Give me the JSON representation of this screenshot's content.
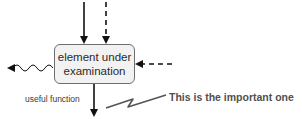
{
  "diagram": {
    "box": {
      "line1": "element under",
      "line2": "examination"
    },
    "labels": {
      "useful_function": "useful function",
      "annotation": "This is the important one"
    },
    "arrows": [
      {
        "id": "input-solid",
        "style": "solid",
        "direction": "down",
        "target": "box-top"
      },
      {
        "id": "input-dashed",
        "style": "dashed",
        "direction": "down",
        "target": "box-top"
      },
      {
        "id": "input-dashed-right",
        "style": "dashed",
        "direction": "left",
        "target": "box-right"
      },
      {
        "id": "output-wavy",
        "style": "wavy",
        "direction": "left",
        "source": "box-left"
      },
      {
        "id": "output-useful",
        "style": "solid",
        "direction": "down",
        "source": "box-bottom"
      }
    ],
    "colors": {
      "stroke": "#111111",
      "box_fill": "#f2f2f2",
      "box_border": "#6e6e6e",
      "pointer": "#555555"
    }
  }
}
